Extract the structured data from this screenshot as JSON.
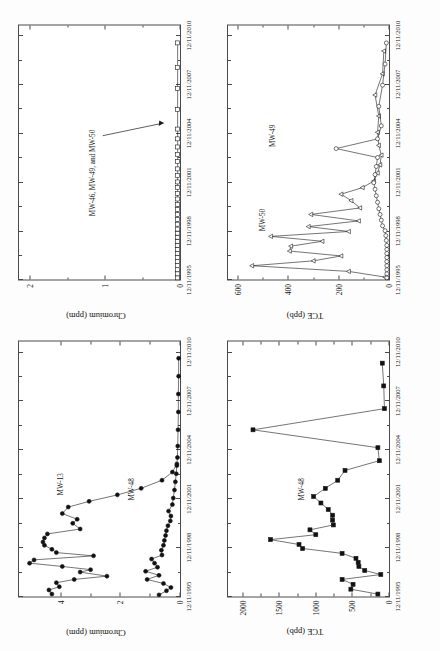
{
  "document": {
    "orientation": "landscape-rotated",
    "page_marker": ""
  },
  "axis": {
    "x_ticks": [
      "12/11/1995",
      "12/11/1998",
      "12/11/2001",
      "12/11/2004",
      "12/11/2007",
      "12/11/2010"
    ],
    "x_label": "",
    "x_min": 1995.95,
    "x_max": 2011.6
  },
  "colors": {
    "ink": "#1a1a1a",
    "axis": "#4a4a4a",
    "paper": "#ffffff"
  },
  "panels": [
    {
      "id": "chromium-mw13-mw48",
      "position": "top-left",
      "ylabel": "Chromium (ppm)",
      "y_ticks": [
        "0",
        "2",
        "4"
      ],
      "annotations": [
        "MW-13",
        "MW-48"
      ]
    },
    {
      "id": "chromium-mw46-mw49-mw50",
      "position": "top-right",
      "ylabel": "Chromium (ppm)",
      "y_ticks": [
        "0",
        "1",
        "2"
      ],
      "annotations": [
        "MW-46, MW-49, and MW-50"
      ]
    },
    {
      "id": "tce-mw48",
      "position": "bottom-left",
      "ylabel": "TCE (ppb)",
      "y_ticks": [
        "0",
        "500",
        "1000",
        "1500",
        "2000"
      ],
      "annotations": [
        "MW-48"
      ]
    },
    {
      "id": "tce-mw49-mw50",
      "position": "bottom-right",
      "ylabel": "TCE (ppb)",
      "y_ticks": [
        "0",
        "200",
        "400",
        "600"
      ],
      "annotations": [
        "MW-50",
        "MW-49"
      ]
    }
  ],
  "chart_data": [
    {
      "type": "line",
      "id": "chromium-mw13-mw48",
      "title": "",
      "xlabel": "",
      "ylabel": "Chromium (ppm)",
      "xlim": [
        1995.95,
        2011.6
      ],
      "ylim": [
        0,
        5.4
      ],
      "y_ticks": [
        0,
        2,
        4
      ],
      "x_ticks": [
        "12/11/1995",
        "12/11/1998",
        "12/11/2001",
        "12/11/2004",
        "12/11/2007",
        "12/11/2010"
      ],
      "grid": false,
      "legend": "annotated-inline",
      "series": [
        {
          "name": "MW-13",
          "marker": "filled-circle",
          "x": [
            1996.1,
            1996.35,
            1996.55,
            1996.8,
            1997.0,
            1997.2,
            1997.45,
            1997.6,
            1997.8,
            1998.0,
            1998.2,
            1998.45,
            1998.65,
            1998.85,
            1999.1,
            1999.3,
            1999.55,
            1999.8,
            2000.1,
            2000.45,
            2000.7,
            2001.05,
            2001.45,
            2001.8,
            2002.2,
            2002.6,
            2003.1,
            2003.6,
            2004.1
          ],
          "y": [
            4.3,
            4.4,
            4.05,
            4.15,
            3.55,
            2.45,
            3.35,
            3.0,
            3.95,
            5.05,
            4.9,
            2.9,
            4.15,
            4.3,
            4.55,
            4.6,
            4.55,
            4.45,
            3.35,
            3.6,
            3.45,
            3.95,
            3.75,
            3.05,
            2.1,
            1.3,
            0.6,
            0.25,
            0.1
          ]
        },
        {
          "name": "MW-48",
          "marker": "filled-circle",
          "x": [
            1996.05,
            1996.3,
            1996.5,
            1996.75,
            1997.0,
            1997.25,
            1997.5,
            1997.75,
            1998.0,
            1998.25,
            1998.5,
            1998.8,
            1999.1,
            1999.4,
            1999.7,
            2000.0,
            2000.3,
            2000.6,
            2000.9,
            2001.2,
            2001.6,
            2002.0,
            2002.5,
            2003.0,
            2003.5,
            2004.0,
            2004.5,
            2005.2,
            2006.2,
            2007.3,
            2008.4,
            2009.5,
            2010.6
          ],
          "y": [
            0.7,
            0.45,
            0.3,
            0.55,
            1.1,
            0.7,
            1.15,
            0.75,
            0.85,
            0.95,
            0.6,
            0.62,
            0.55,
            0.52,
            0.48,
            0.45,
            0.4,
            0.32,
            0.3,
            0.38,
            0.25,
            0.22,
            0.18,
            0.15,
            0.12,
            0.1,
            0.08,
            0.07,
            0.06,
            0.05,
            0.05,
            0.04,
            0.04
          ]
        }
      ]
    },
    {
      "type": "line",
      "id": "chromium-mw46-mw49-mw50",
      "title": "",
      "xlabel": "",
      "ylabel": "Chromium (ppm)",
      "xlim": [
        1995.95,
        2011.6
      ],
      "ylim": [
        0,
        2.15
      ],
      "y_ticks": [
        0,
        1,
        2
      ],
      "x_ticks": [
        "12/11/1995",
        "12/11/1998",
        "12/11/2001",
        "12/11/2004",
        "12/11/2007",
        "12/11/2010"
      ],
      "grid": false,
      "legend": "annotated-inline",
      "series": [
        {
          "name": "MW-46, MW-49, and MW-50",
          "marker": "open-square",
          "x": [
            1996.05,
            1996.3,
            1996.55,
            1996.8,
            1997.05,
            1997.3,
            1997.55,
            1997.8,
            1998.05,
            1998.3,
            1998.55,
            1998.8,
            1999.05,
            1999.35,
            1999.65,
            1999.95,
            2000.25,
            2000.55,
            2000.9,
            2001.25,
            2001.6,
            2001.95,
            2002.35,
            2002.75,
            2003.2,
            2003.65,
            2004.1,
            2004.6,
            2005.2,
            2006.4,
            2007.7,
            2009.0,
            2010.5
          ],
          "y": [
            0.03,
            0.03,
            0.03,
            0.03,
            0.03,
            0.03,
            0.03,
            0.03,
            0.03,
            0.03,
            0.03,
            0.03,
            0.03,
            0.03,
            0.03,
            0.03,
            0.03,
            0.03,
            0.03,
            0.03,
            0.03,
            0.03,
            0.03,
            0.03,
            0.03,
            0.03,
            0.03,
            0.03,
            0.03,
            0.03,
            0.03,
            0.03,
            0.03
          ]
        }
      ]
    },
    {
      "type": "line",
      "id": "tce-mw48",
      "title": "",
      "xlabel": "",
      "ylabel": "TCE (ppb)",
      "xlim": [
        1995.95,
        2011.6
      ],
      "ylim": [
        0,
        2200
      ],
      "y_ticks": [
        0,
        500,
        1000,
        1500,
        2000
      ],
      "x_ticks": [
        "12/11/1995",
        "12/11/1998",
        "12/11/2001",
        "12/11/2004",
        "12/11/2007",
        "12/11/2010"
      ],
      "grid": false,
      "legend": "annotated-inline",
      "series": [
        {
          "name": "MW-48",
          "marker": "filled-square",
          "x": [
            1996.1,
            1996.4,
            1996.7,
            1997.0,
            1997.3,
            1997.55,
            1997.8,
            1998.05,
            1998.3,
            1998.6,
            1998.9,
            1999.15,
            1999.45,
            1999.75,
            2000.05,
            2000.35,
            2000.65,
            2000.95,
            2001.3,
            2001.7,
            2002.1,
            2002.6,
            2003.1,
            2003.7,
            2004.3,
            2005.1,
            2006.2,
            2007.5,
            2008.9,
            2010.3
          ],
          "y": [
            150,
            520,
            490,
            640,
            110,
            330,
            410,
            420,
            450,
            640,
            1180,
            1230,
            1620,
            1000,
            1080,
            760,
            770,
            770,
            830,
            930,
            1030,
            870,
            700,
            600,
            130,
            150,
            1860,
            60,
            70,
            90
          ]
        }
      ]
    },
    {
      "type": "line",
      "id": "tce-mw49-mw50",
      "title": "",
      "xlabel": "",
      "ylabel": "TCE (ppb)",
      "xlim": [
        1995.95,
        2011.6
      ],
      "ylim": [
        0,
        640
      ],
      "y_ticks": [
        0,
        200,
        400,
        600
      ],
      "x_ticks": [
        "12/11/1995",
        "12/11/1998",
        "12/11/2001",
        "12/11/2004",
        "12/11/2007",
        "12/11/2010"
      ],
      "grid": false,
      "legend": "annotated-inline",
      "series": [
        {
          "name": "MW-50",
          "marker": "open-triangle",
          "x": [
            1996.1,
            1996.45,
            1996.8,
            1997.1,
            1997.4,
            1997.7,
            1998.0,
            1998.3,
            1998.6,
            1998.9,
            1999.2,
            1999.55,
            1999.95,
            2000.35,
            2000.8,
            2001.2,
            2001.6,
            2002.0,
            2002.5,
            2003.0,
            2003.6,
            2004.2,
            2005.0,
            2006.0,
            2007.3,
            2008.6,
            2010.0
          ],
          "y": [
            15,
            160,
            545,
            300,
            190,
            395,
            390,
            265,
            470,
            160,
            320,
            120,
            310,
            115,
            150,
            190,
            105,
            60,
            45,
            35,
            30,
            40,
            45,
            40,
            55,
            25,
            20
          ]
        },
        {
          "name": "MW-49",
          "marker": "open-circle",
          "x": [
            1996.05,
            1996.3,
            1996.55,
            1996.8,
            1997.05,
            1997.3,
            1997.55,
            1997.8,
            1998.05,
            1998.35,
            1998.65,
            1998.95,
            1999.25,
            1999.6,
            1999.95,
            2000.3,
            2000.7,
            2001.1,
            2001.5,
            2001.9,
            2002.4,
            2002.9,
            2003.45,
            2004.0,
            2004.6,
            2005.4,
            2006.6,
            2007.9,
            2009.2,
            2010.5
          ],
          "y": [
            8,
            8,
            8,
            8,
            8,
            8,
            8,
            8,
            8,
            10,
            12,
            15,
            25,
            30,
            35,
            40,
            45,
            50,
            55,
            60,
            55,
            50,
            45,
            210,
            45,
            30,
            40,
            25,
            15,
            10
          ]
        }
      ]
    }
  ]
}
